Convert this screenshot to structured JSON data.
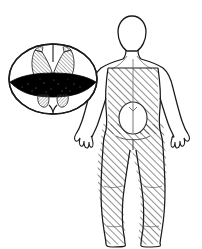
{
  "illustration": {
    "title": "Spinal cord cross-section with posterior body sensory-loss diagram",
    "subject": "anterior-spinal-cord-lesion",
    "background_color": "#ffffff",
    "ink_color": "#1a1a1a",
    "lesion_fill_color": "#000000",
    "hatch_color": "#3a3a3a",
    "panels": [
      {
        "id": "spinal-cord-panel",
        "label": "Spinal cord cross-section",
        "position": "left",
        "features": [
          {
            "name": "cord-outline",
            "label": "Spinal cord outline",
            "shape": "oval"
          },
          {
            "name": "anterior-median-fissure",
            "label": "Anterior median fissure",
            "shape": "notch"
          },
          {
            "name": "posterior-median-sulcus",
            "label": "Posterior median sulcus",
            "shape": "cleft"
          },
          {
            "name": "gray-matter-butterfly",
            "label": "Gray matter (butterfly)",
            "shading": "hatched"
          },
          {
            "name": "dorsal-horn-left",
            "label": "Left dorsal horn",
            "shading": "hatched"
          },
          {
            "name": "dorsal-horn-right",
            "label": "Right dorsal horn",
            "shading": "hatched"
          },
          {
            "name": "ventral-horn-left",
            "label": "Left ventral horn",
            "shading": "hatched"
          },
          {
            "name": "ventral-horn-right",
            "label": "Right ventral horn",
            "shading": "hatched"
          },
          {
            "name": "lesion-band",
            "label": "Lesion (infarcted anterior territory)",
            "shading": "solid-black"
          }
        ]
      },
      {
        "id": "body-panel",
        "label": "Human body, posterior view",
        "position": "right",
        "view": "posterior",
        "features": [
          {
            "name": "head",
            "label": "Head",
            "shading": "none"
          },
          {
            "name": "neck",
            "label": "Neck",
            "shading": "none"
          },
          {
            "name": "torso-upper",
            "label": "Upper chest and shoulders",
            "shading": "none"
          },
          {
            "name": "torso-lower",
            "label": "Trunk below sensory level",
            "shading": "hatched"
          },
          {
            "name": "arm-left",
            "label": "Left arm",
            "shading": "none"
          },
          {
            "name": "arm-right",
            "label": "Right arm",
            "shading": "none"
          },
          {
            "name": "hand-left",
            "label": "Left hand",
            "shading": "none"
          },
          {
            "name": "hand-right",
            "label": "Right hand",
            "shading": "none"
          },
          {
            "name": "leg-left",
            "label": "Left leg",
            "shading": "hatched"
          },
          {
            "name": "leg-right",
            "label": "Right leg",
            "shading": "hatched"
          },
          {
            "name": "foot-left",
            "label": "Left foot",
            "shading": "hatched"
          },
          {
            "name": "foot-right",
            "label": "Right foot",
            "shading": "hatched"
          },
          {
            "name": "spared-oval",
            "label": "Spared sacral region",
            "shading": "none"
          },
          {
            "name": "sensory-level-line",
            "label": "Sensory level boundary",
            "shading": "none"
          }
        ]
      }
    ]
  }
}
